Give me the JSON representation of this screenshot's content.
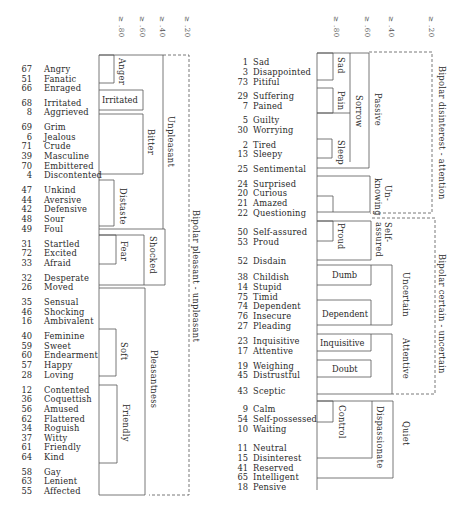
{
  "left_panel": {
    "scale": [
      {
        "label": "≥ .80",
        "x": 120
      },
      {
        "label": "≥ .60",
        "x": 141
      },
      {
        "label": "≥ .40",
        "x": 161
      },
      {
        "label": "≥ .20",
        "x": 186
      }
    ],
    "items": [
      {
        "num": "67",
        "word": "Angry",
        "y": 64
      },
      {
        "num": "51",
        "word": "Fanatic",
        "y": 74
      },
      {
        "num": "66",
        "word": "Enraged",
        "y": 83
      },
      {
        "num": "68",
        "word": "Irritated",
        "y": 98
      },
      {
        "num": "8",
        "word": "Aggrieved",
        "y": 107
      },
      {
        "num": "69",
        "word": "Grim",
        "y": 122
      },
      {
        "num": "6",
        "word": "Jealous",
        "y": 132
      },
      {
        "num": "71",
        "word": "Crude",
        "y": 141
      },
      {
        "num": "39",
        "word": "Masculine",
        "y": 151
      },
      {
        "num": "70",
        "word": "Embittered",
        "y": 161
      },
      {
        "num": "4",
        "word": "Discontented",
        "y": 170
      },
      {
        "num": "47",
        "word": "Unkind",
        "y": 185
      },
      {
        "num": "44",
        "word": "Aversive",
        "y": 195
      },
      {
        "num": "42",
        "word": "Defensive",
        "y": 204
      },
      {
        "num": "48",
        "word": "Sour",
        "y": 214
      },
      {
        "num": "49",
        "word": "Foul",
        "y": 224
      },
      {
        "num": "31",
        "word": "Startled",
        "y": 239
      },
      {
        "num": "72",
        "word": "Excited",
        "y": 248
      },
      {
        "num": "33",
        "word": "Afraid",
        "y": 258
      },
      {
        "num": "32",
        "word": "Desperate",
        "y": 273
      },
      {
        "num": "26",
        "word": "Moved",
        "y": 282
      },
      {
        "num": "35",
        "word": "Sensual",
        "y": 297
      },
      {
        "num": "46",
        "word": "Shocking",
        "y": 307
      },
      {
        "num": "16",
        "word": "Ambivalent",
        "y": 316
      },
      {
        "num": "40",
        "word": "Feminine",
        "y": 331
      },
      {
        "num": "59",
        "word": "Sweet",
        "y": 341
      },
      {
        "num": "60",
        "word": "Endearment",
        "y": 350
      },
      {
        "num": "57",
        "word": "Happy",
        "y": 360
      },
      {
        "num": "28",
        "word": "Loving",
        "y": 370
      },
      {
        "num": "12",
        "word": "Contented",
        "y": 385
      },
      {
        "num": "36",
        "word": "Coquettish",
        "y": 394
      },
      {
        "num": "56",
        "word": "Amused",
        "y": 404
      },
      {
        "num": "62",
        "word": "Flattered",
        "y": 414
      },
      {
        "num": "34",
        "word": "Roguish",
        "y": 423
      },
      {
        "num": "37",
        "word": "Witty",
        "y": 433
      },
      {
        "num": "61",
        "word": "Friendly",
        "y": 442
      },
      {
        "num": "64",
        "word": "Kind",
        "y": 452
      },
      {
        "num": "58",
        "word": "Gay",
        "y": 467
      },
      {
        "num": "63",
        "word": "Lenient",
        "y": 476
      },
      {
        "num": "55",
        "word": "Affected",
        "y": 486
      }
    ],
    "clusters": {
      "anger": "Anger",
      "irritated": "Irritated",
      "bitter": "Bitter",
      "distaste": "Distaste",
      "fear": "Fear",
      "shocked": "Shocked",
      "unpleasant": "Unpleasant",
      "soft": "Soft",
      "friendly": "Friendly",
      "pleasantness": "Pleasantness",
      "bipolar": "Bipolar pleasant - unpleasant"
    }
  },
  "right_panel": {
    "scale": [
      {
        "label": "≥ .80",
        "x": 335
      },
      {
        "label": "≥ .60",
        "x": 366
      },
      {
        "label": "≥ .40",
        "x": 390
      },
      {
        "label": "≥ .20",
        "x": 430
      }
    ],
    "items": [
      {
        "num": "1",
        "word": "Sad",
        "y": 57
      },
      {
        "num": "3",
        "word": "Disappointed",
        "y": 67
      },
      {
        "num": "73",
        "word": "Pitiful",
        "y": 77
      },
      {
        "num": "29",
        "word": "Suffering",
        "y": 91
      },
      {
        "num": "7",
        "word": "Pained",
        "y": 101
      },
      {
        "num": "5",
        "word": "Guilty",
        "y": 115
      },
      {
        "num": "30",
        "word": "Worrying",
        "y": 125
      },
      {
        "num": "2",
        "word": "Tired",
        "y": 140
      },
      {
        "num": "13",
        "word": "Sleepy",
        "y": 149
      },
      {
        "num": "25",
        "word": "Sentimental",
        "y": 164
      },
      {
        "num": "24",
        "word": "Surprised",
        "y": 179
      },
      {
        "num": "20",
        "word": "Curious",
        "y": 188
      },
      {
        "num": "21",
        "word": "Amazed",
        "y": 198
      },
      {
        "num": "22",
        "word": "Questioning",
        "y": 208
      },
      {
        "num": "50",
        "word": "Self-assured",
        "y": 227
      },
      {
        "num": "53",
        "word": "Proud",
        "y": 237
      },
      {
        "num": "52",
        "word": "Disdain",
        "y": 256
      },
      {
        "num": "38",
        "word": "Childish",
        "y": 272
      },
      {
        "num": "14",
        "word": "Stupid",
        "y": 282
      },
      {
        "num": "75",
        "word": "Timid",
        "y": 292
      },
      {
        "num": "74",
        "word": "Dependent",
        "y": 301
      },
      {
        "num": "76",
        "word": "Insecure",
        "y": 311
      },
      {
        "num": "27",
        "word": "Pleading",
        "y": 321
      },
      {
        "num": "23",
        "word": "Inquisitive",
        "y": 336
      },
      {
        "num": "17",
        "word": "Attentive",
        "y": 346
      },
      {
        "num": "19",
        "word": "Weighing",
        "y": 361
      },
      {
        "num": "45",
        "word": "Distrustful",
        "y": 370
      },
      {
        "num": "43",
        "word": "Sceptic",
        "y": 386
      },
      {
        "num": "9",
        "word": "Calm",
        "y": 404
      },
      {
        "num": "54",
        "word": "Self-possessed",
        "y": 414
      },
      {
        "num": "10",
        "word": "Waiting",
        "y": 424
      },
      {
        "num": "11",
        "word": "Neutral",
        "y": 443
      },
      {
        "num": "15",
        "word": "Disinterest",
        "y": 453
      },
      {
        "num": "41",
        "word": "Reserved",
        "y": 463
      },
      {
        "num": "65",
        "word": "Intelligent",
        "y": 472
      },
      {
        "num": "18",
        "word": "Pensive",
        "y": 482
      }
    ],
    "clusters": {
      "sad": "Sad",
      "pain": "Pain",
      "sorrow": "Sorrow",
      "sleep": "Sleep",
      "passive": "Passive",
      "unknowing": "Un-\nknowing",
      "unknowing_1": "Un-",
      "unknowing_2": "knowing",
      "proud": "Proud",
      "selfassured_1": "Self-",
      "selfassured_2": "assured",
      "dumb": "Dumb",
      "dependent": "Dependent",
      "uncertain": "Uncertain",
      "inquisitive": "Inquisitive",
      "doubt": "Doubt",
      "attentive": "Attentive",
      "control": "Control",
      "dispassionate": "Dispassionate",
      "quiet": "Quiet",
      "bipolar_top": "Bipolar disinterest - attention",
      "bipolar_bottom": "Bipolar certain - uncertain"
    }
  }
}
